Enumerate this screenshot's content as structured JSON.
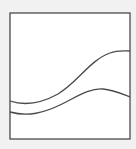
{
  "diagram": {
    "background_color": "#f1f1f1",
    "frame": {
      "x": 10,
      "y": 13,
      "width": 120,
      "height": 126,
      "fill": "#ffffff",
      "stroke": "#4a4a4a",
      "stroke_width": 1.3
    },
    "curves": [
      {
        "name": "upper-wave",
        "path": "M10,101 C25,106 40,104 58,94 C78,82 90,60 110,53 C118,50 124,51 130,51",
        "stroke": "#4a4a4a",
        "stroke_width": 1.3
      },
      {
        "name": "lower-wave",
        "path": "M10,112 C28,117 44,113 62,104 C78,96 90,88 103,89 C114,90 122,94 130,97",
        "stroke": "#4a4a4a",
        "stroke_width": 1.3
      }
    ]
  }
}
